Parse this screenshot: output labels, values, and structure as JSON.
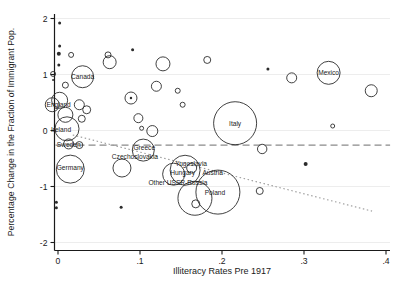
{
  "figure": {
    "y_axis_title": "Percentage Change in the Fraction of Immigrant Pop.",
    "x_axis_title": "Illiteracy Rates Pre 1917",
    "y_tick_labels": [
      "-2",
      "-1",
      "0",
      "1",
      "2"
    ],
    "y_tick_values": [
      -2,
      -1,
      0,
      1,
      2
    ],
    "x_tick_labels": [
      "0",
      ".1",
      ".2",
      ".3",
      ".4"
    ],
    "x_tick_values": [
      0,
      0.1,
      0.2,
      0.3,
      0.4
    ],
    "colors": {
      "axis": "#1a1a1a",
      "bubble_stroke": "#2b2b2b",
      "gridline": "#ededed",
      "dashed_line": "#8a8a8a",
      "dotted_line": "#9a9a9a",
      "label_text": "#1a1a1a"
    }
  },
  "chart_data": {
    "type": "scatter",
    "title": "",
    "xlabel": "Illiteracy Rates Pre 1917",
    "ylabel": "Percentage Change in the Fraction of Immigrant Pop.",
    "xlim": [
      -0.01,
      0.42
    ],
    "ylim": [
      -2.15,
      2.1
    ],
    "grid": "horizontal-light",
    "legend": "none",
    "reference_lines": [
      {
        "name": "dashed-horizontal-mean",
        "style": "dashed",
        "y": -0.26,
        "x1": -0.003,
        "x2": 0.405
      },
      {
        "name": "dotted-trend",
        "style": "dotted",
        "x1": 0.018,
        "y1": -0.08,
        "x2": 0.383,
        "y2": -1.44
      }
    ],
    "labeled_points": [
      {
        "label": "Canada",
        "x": 0.03,
        "y": 0.96,
        "r": 11,
        "ldx": 0,
        "ldy": 0
      },
      {
        "label": "England",
        "x": 0.002,
        "y": 0.54,
        "r": 8,
        "ldx": -1,
        "ldy": 4
      },
      {
        "label": "Ireland",
        "x": 0.011,
        "y": 0.03,
        "r": 12,
        "ldx": -6,
        "ldy": 1
      },
      {
        "label": "Sweden",
        "x": 0.013,
        "y": -0.24,
        "r": 5,
        "ldx": 0,
        "ldy": 1
      },
      {
        "label": "Germany",
        "x": 0.015,
        "y": -0.69,
        "r": 14,
        "ldx": 0,
        "ldy": -1
      },
      {
        "label": "Greece",
        "x": 0.104,
        "y": -0.35,
        "r": 11,
        "ldx": 1,
        "ldy": -2
      },
      {
        "label": "Czechoslovakia",
        "x": 0.078,
        "y": -0.67,
        "r": 9,
        "ldx": 13,
        "ldy": -11
      },
      {
        "label": "Yugoslavia",
        "x": 0.155,
        "y": -0.71,
        "r": 15,
        "ldx": 6,
        "ldy": -7
      },
      {
        "label": "Hungary",
        "x": 0.141,
        "y": -0.78,
        "r": 11,
        "ldx": 9,
        "ldy": -1
      },
      {
        "label": "Austria",
        "x": 0.163,
        "y": -0.67,
        "r": 5,
        "ldx": 21,
        "ldy": 5
      },
      {
        "label": "Other USSR-Russia",
        "x": 0.167,
        "y": -1.21,
        "r": 17,
        "ldx": -17,
        "ldy": -16
      },
      {
        "label": "Poland",
        "x": 0.195,
        "y": -1.1,
        "r": 22,
        "ldx": -3,
        "ldy": 1
      },
      {
        "label": "Italy",
        "x": 0.216,
        "y": 0.13,
        "r": 21.5,
        "ldx": 0,
        "ldy": 0
      },
      {
        "label": "Mexico",
        "x": 0.33,
        "y": 1.03,
        "r": 11.5,
        "ldx": 0,
        "ldy": 0
      }
    ],
    "points": [
      {
        "x": 0.002,
        "y": 1.92,
        "r": 1.5,
        "filled": true
      },
      {
        "x": 0.002,
        "y": 1.51,
        "r": 1.5,
        "filled": true
      },
      {
        "x": 0.001,
        "y": 1.37,
        "r": 2,
        "filled": true
      },
      {
        "x": 0.016,
        "y": 1.35,
        "r": 2.5
      },
      {
        "x": 0.001,
        "y": 1.17,
        "r": 1.5,
        "filled": true
      },
      {
        "x": -0.006,
        "y": 1.01,
        "r": 2.5
      },
      {
        "x": -0.006,
        "y": 0.9,
        "r": 1,
        "filled": true
      },
      {
        "x": 0.009,
        "y": 0.81,
        "r": 3
      },
      {
        "x": 0.061,
        "y": 1.35,
        "r": 3
      },
      {
        "x": 0.063,
        "y": 1.22,
        "r": 6.5
      },
      {
        "x": 0.091,
        "y": 1.44,
        "r": 1.5,
        "filled": true
      },
      {
        "x": 0.128,
        "y": 1.19,
        "r": 7
      },
      {
        "x": 0.12,
        "y": 0.79,
        "r": 5
      },
      {
        "x": 0.146,
        "y": 0.71,
        "r": 2.5
      },
      {
        "x": 0.089,
        "y": 0.58,
        "r": 6,
        "center_dot": true
      },
      {
        "x": 0.182,
        "y": 1.26,
        "r": 3.5
      },
      {
        "x": 0.256,
        "y": 1.1,
        "r": 1.5,
        "filled": true
      },
      {
        "x": 0.285,
        "y": 0.94,
        "r": 5
      },
      {
        "x": 0.382,
        "y": 0.71,
        "r": 6
      },
      {
        "x": 0.335,
        "y": 0.08,
        "r": 2
      },
      {
        "x": -0.007,
        "y": 0.46,
        "r": 7
      },
      {
        "x": 0.009,
        "y": 0.28,
        "r": 7.5
      },
      {
        "x": 0.026,
        "y": 0.46,
        "r": 5
      },
      {
        "x": 0.035,
        "y": 0.37,
        "r": 4
      },
      {
        "x": 0.029,
        "y": 0.21,
        "r": 3.5
      },
      {
        "x": 0.152,
        "y": 0.46,
        "r": 2.5
      },
      {
        "x": 0.098,
        "y": 0.22,
        "r": 4.5
      },
      {
        "x": 0.102,
        "y": 0.04,
        "r": 2
      },
      {
        "x": 0.115,
        "y": -0.01,
        "r": 5.5
      },
      {
        "x": 0.026,
        "y": -0.26,
        "r": 3.5
      },
      {
        "x": 0.249,
        "y": -0.33,
        "r": 4.7
      },
      {
        "x": 0.246,
        "y": -1.08,
        "r": 3.5
      },
      {
        "x": 0.302,
        "y": -0.6,
        "r": 2,
        "filled": true
      },
      {
        "x": 0.077,
        "y": -1.37,
        "r": 1.5,
        "filled": true
      },
      {
        "x": -0.002,
        "y": -1.28,
        "r": 1.5,
        "filled": true
      },
      {
        "x": -0.002,
        "y": -1.38,
        "r": 1.5,
        "filled": true
      },
      {
        "x": 0.168,
        "y": -1.31,
        "r": 4
      }
    ]
  }
}
